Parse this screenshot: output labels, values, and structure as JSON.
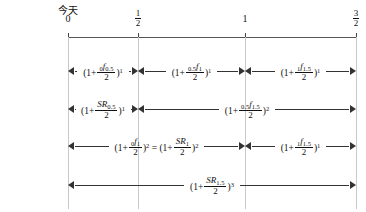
{
  "timeline": {
    "today_label": "今天",
    "ticks": [
      {
        "id": "t0",
        "label_type": "int",
        "value": "0",
        "x": 68
      },
      {
        "id": "thalf",
        "label_type": "frac",
        "num": "1",
        "den": "2",
        "x": 138
      },
      {
        "id": "t1",
        "label_type": "int",
        "value": "1",
        "x": 245
      },
      {
        "id": "t32",
        "label_type": "frac",
        "num": "3",
        "den": "2",
        "x": 356
      }
    ]
  },
  "rows": [
    {
      "id": "row-1",
      "name": "six-month-forward-factors",
      "segments": [
        {
          "id": "r1s1",
          "from_x": 68,
          "to_x": 138,
          "left_arrow": true,
          "right_arrow": true,
          "formula": {
            "open": "(1+",
            "numerator_presub": "0",
            "numerator_symbol": "f",
            "numerator_sub": "0.5",
            "denominator": "2",
            "close": ")",
            "exponent": "1"
          }
        },
        {
          "id": "r1s2",
          "from_x": 138,
          "to_x": 245,
          "left_arrow": true,
          "right_arrow": true,
          "formula": {
            "open": "(1+",
            "numerator_presub": "0.5",
            "numerator_symbol": "f",
            "numerator_sub": "1",
            "denominator": "2",
            "close": ")",
            "exponent": "1"
          }
        },
        {
          "id": "r1s3",
          "from_x": 245,
          "to_x": 356,
          "left_arrow": true,
          "right_arrow": true,
          "formula": {
            "open": "(1+",
            "numerator_presub": "1",
            "numerator_symbol": "f",
            "numerator_sub": "1.5",
            "denominator": "2",
            "close": ")",
            "exponent": "1"
          }
        }
      ]
    },
    {
      "id": "row-2",
      "name": "spot-and-forward-factors",
      "segments": [
        {
          "id": "r2s1",
          "from_x": 68,
          "to_x": 138,
          "left_arrow": true,
          "right_arrow": true,
          "formula": {
            "open": "(1+",
            "numerator_presub": "",
            "numerator_symbol": "SR",
            "numerator_sub": "0.5",
            "denominator": "2",
            "close": ")",
            "exponent": "1"
          }
        },
        {
          "id": "r2s2",
          "from_x": 138,
          "to_x": 356,
          "left_arrow": true,
          "right_arrow": true,
          "formula": {
            "open": "(1+",
            "numerator_presub": "0.5",
            "numerator_symbol": "f",
            "numerator_sub": "1.5",
            "denominator": "2",
            "close": ")",
            "exponent": "2"
          }
        }
      ]
    },
    {
      "id": "row-3",
      "name": "one-year-equivalence",
      "segments": [
        {
          "id": "r3s1",
          "from_x": 68,
          "to_x": 245,
          "left_arrow": true,
          "right_arrow": true,
          "formula": {
            "open": "(1+",
            "numerator_presub": "0",
            "numerator_symbol": "f",
            "numerator_sub": "1",
            "denominator": "2",
            "close": ")",
            "exponent": "2",
            "equals": "=",
            "open2": "(1+",
            "numerator2_symbol": "SR",
            "numerator2_sub": "1",
            "denominator2": "2",
            "close2": ")",
            "exponent2": "2"
          }
        },
        {
          "id": "r3s2",
          "from_x": 245,
          "to_x": 356,
          "left_arrow": true,
          "right_arrow": true,
          "formula": {
            "open": "(1+",
            "numerator_presub": "1",
            "numerator_symbol": "f",
            "numerator_sub": "1.5",
            "denominator": "2",
            "close": ")",
            "exponent": "1"
          }
        }
      ]
    },
    {
      "id": "row-4",
      "name": "eighteen-month-spot-factor",
      "segments": [
        {
          "id": "r4s1",
          "from_x": 68,
          "to_x": 356,
          "left_arrow": true,
          "right_arrow": true,
          "formula": {
            "open": "(1+",
            "numerator_presub": "",
            "numerator_symbol": "SR",
            "numerator_sub": "1.5",
            "denominator": "2",
            "close": ")",
            "exponent": "3"
          }
        }
      ]
    }
  ],
  "colors": {
    "axis": "#555555",
    "tick": "#444444",
    "guide": "#c9c9c9",
    "arrow": "#333333",
    "text": "#111111",
    "background": "#ffffff"
  }
}
